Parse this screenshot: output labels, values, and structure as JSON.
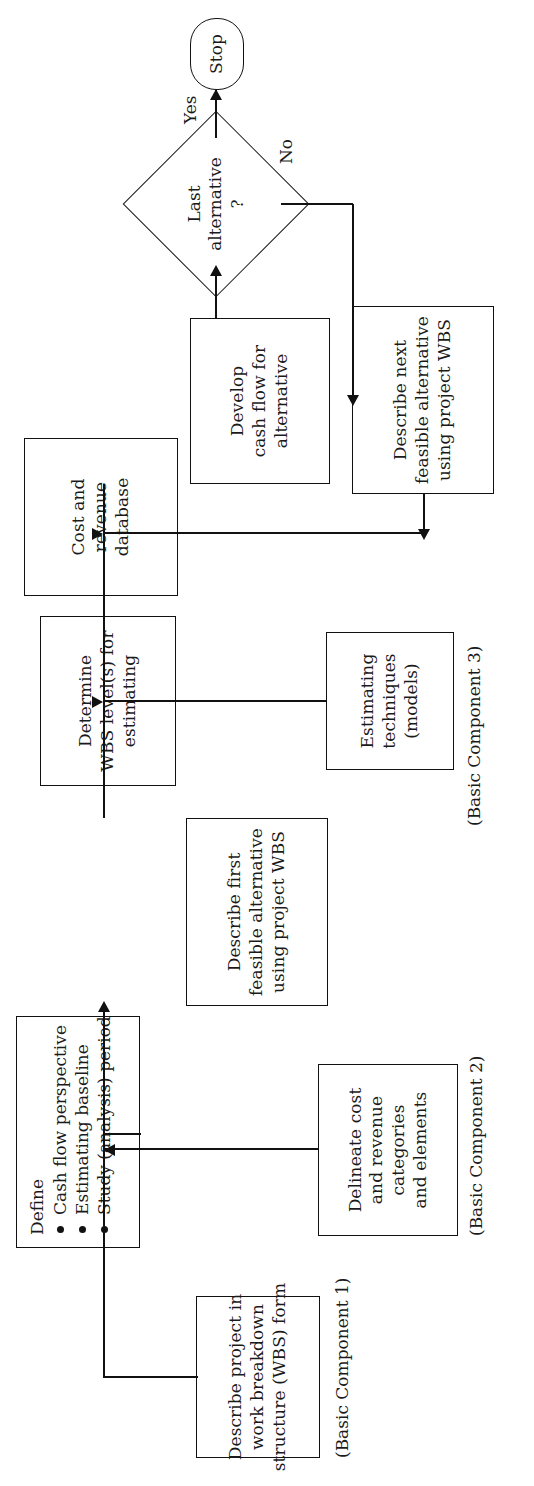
{
  "figure": {
    "kind": "flowchart",
    "orientation_note": "page scanned rotated 90 degrees",
    "ghost_caption": ""
  },
  "nodes": {
    "stop": {
      "label": "Stop",
      "shape": "terminal"
    },
    "decision": {
      "line1": "Last",
      "line2": "alternative",
      "line3": "?",
      "shape": "diamond"
    },
    "develop_cash_flow": {
      "line1": "Develop",
      "line2": "cash flow for",
      "line3": "alternative"
    },
    "describe_next": {
      "line1": "Describe next",
      "line2": "feasible alternative",
      "line3": "using project WBS"
    },
    "cost_revenue_db": {
      "line1": "Cost and",
      "line2": "revenue",
      "line3": "database"
    },
    "determine_wbs_level": {
      "line1": "Determine",
      "line2": "WBS level(s) for",
      "line3": "estimating"
    },
    "estimating_techniques": {
      "line1": "Estimating",
      "line2": "techniques",
      "line3": "(models)"
    },
    "describe_first": {
      "line1": "Describe first",
      "line2": "feasible alternative",
      "line3": "using project WBS"
    },
    "define": {
      "title": "Define",
      "bullets": [
        "Cash flow perspective",
        "Estimating baseline",
        "Study (analysis) period"
      ]
    },
    "delineate": {
      "line1": "Delineate cost",
      "line2": "and revenue",
      "line3": "categories",
      "line4": "and elements"
    },
    "describe_project_wbs": {
      "line1": "Describe project in",
      "line2": "work breakdown",
      "line3": "structure (WBS) form"
    }
  },
  "edge_labels": {
    "yes": "Yes",
    "no": "No"
  },
  "component_labels": {
    "component1": "(Basic Component 1)",
    "component2": "(Basic Component 2)",
    "component3": "(Basic Component 3)"
  },
  "colors": {
    "ink": "#111111",
    "paper": "#ffffff"
  }
}
